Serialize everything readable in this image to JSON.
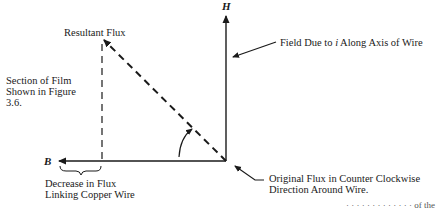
{
  "diagram": {
    "axes": {
      "vertical_label": "H",
      "horizontal_label": "B"
    },
    "labels": {
      "resultant_flux": "Resultant Flux",
      "section_of_film_1": "Section of Film",
      "section_of_film_2": "Shown in Figure",
      "section_of_film_3": "3.6.",
      "field_due_prefix": "Field Due to ",
      "field_due_var": "i",
      "field_due_suffix": " Along Axis of Wire",
      "decrease_1": "Decrease in Flux",
      "decrease_2": "Linking Copper Wire",
      "original_1": "Original Flux in Counter Clockwise",
      "original_2": "Direction Around Wire.",
      "cutoff_text": "· · · · · · · · ·  ·  ·  ·  ·  of the"
    },
    "colors": {
      "ink": "#1a1a1a",
      "background": "#ffffff"
    }
  }
}
